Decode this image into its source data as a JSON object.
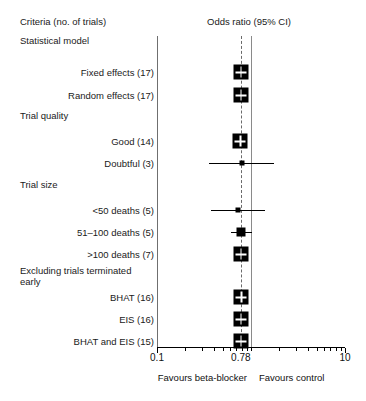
{
  "headers": {
    "left": "Criteria (no. of trials)",
    "right": "Odds ratio (95% CI)"
  },
  "rows": [
    {
      "label": "Statistical model",
      "type": "group",
      "indent": 0
    },
    {
      "label": "Fixed effects (17)",
      "type": "item",
      "indent": 1,
      "or": 0.78,
      "lo": 0.71,
      "hi": 0.86,
      "box": "large"
    },
    {
      "label": "Random effects (17)",
      "type": "item",
      "indent": 1,
      "or": 0.78,
      "lo": 0.7,
      "hi": 0.87,
      "box": "large"
    },
    {
      "label": "Trial quality",
      "type": "group",
      "indent": 0
    },
    {
      "label": "Good (14)",
      "type": "item",
      "indent": 1,
      "or": 0.77,
      "lo": 0.7,
      "hi": 0.85,
      "box": "large"
    },
    {
      "label": "Doubtful (3)",
      "type": "item",
      "indent": 1,
      "or": 0.8,
      "lo": 0.36,
      "hi": 1.75,
      "box": "small"
    },
    {
      "label": "Trial size",
      "type": "group",
      "indent": 0
    },
    {
      "label": "<50 deaths (5)",
      "type": "item",
      "indent": 1,
      "or": 0.73,
      "lo": 0.38,
      "hi": 1.4,
      "box": "small"
    },
    {
      "label": "51–100 deaths (5)",
      "type": "item",
      "indent": 1,
      "or": 0.79,
      "lo": 0.62,
      "hi": 1.02,
      "box": "medium"
    },
    {
      "label": ">100 deaths (7)",
      "type": "item",
      "indent": 1,
      "or": 0.78,
      "lo": 0.7,
      "hi": 0.87,
      "box": "large"
    },
    {
      "label": "Excluding trials terminated early",
      "type": "group",
      "indent": 0,
      "wrap": true
    },
    {
      "label": "BHAT (16)",
      "type": "item",
      "indent": 1,
      "or": 0.79,
      "lo": 0.71,
      "hi": 0.88,
      "box": "large"
    },
    {
      "label": "EIS (16)",
      "type": "item",
      "indent": 1,
      "or": 0.78,
      "lo": 0.7,
      "hi": 0.87,
      "box": "large"
    },
    {
      "label": "BHAT and EIS (15)",
      "type": "item",
      "indent": 1,
      "or": 0.78,
      "lo": 0.7,
      "hi": 0.88,
      "box": "large"
    }
  ],
  "axis": {
    "min": 0.1,
    "max": 10,
    "scale": "log",
    "tick_labels": [
      "0.1",
      "0.78",
      "10"
    ],
    "tick_values": [
      0.1,
      0.78,
      10
    ],
    "minor_ticks": [
      0.2,
      0.3,
      0.4,
      0.5,
      0.6,
      0.7,
      0.8,
      0.9,
      1,
      2,
      3,
      4,
      5,
      6,
      7,
      8,
      9
    ],
    "null_value": 1.0,
    "pooled_value": 0.78
  },
  "footer": {
    "left": "Favours beta-blocker",
    "right": "Favours control"
  },
  "chart_data": {
    "type": "forest",
    "title": "Odds ratio (95% CI)",
    "xlabel": "Odds ratio",
    "xscale": "log",
    "xlim": [
      0.1,
      10
    ],
    "reference_line": 1.0,
    "pooled_line": 0.78,
    "categories": [
      "Fixed effects (17)",
      "Random effects (17)",
      "Good (14)",
      "Doubtful (3)",
      "<50 deaths (5)",
      "51–100 deaths (5)",
      ">100 deaths (7)",
      "BHAT (16)",
      "EIS (16)",
      "BHAT and EIS (15)"
    ],
    "values": [
      0.78,
      0.78,
      0.77,
      0.8,
      0.73,
      0.79,
      0.78,
      0.79,
      0.78,
      0.78
    ],
    "ci_low": [
      0.71,
      0.7,
      0.7,
      0.36,
      0.38,
      0.62,
      0.7,
      0.71,
      0.7,
      0.7
    ],
    "ci_high": [
      0.86,
      0.87,
      0.85,
      1.75,
      1.4,
      1.02,
      0.87,
      0.88,
      0.87,
      0.88
    ],
    "groups": [
      "Statistical model",
      "Trial quality",
      "Trial size",
      "Excluding trials terminated early"
    ],
    "grid": false,
    "legend": false
  },
  "colors": {
    "marker": "#000000",
    "axis": "#000000",
    "null_line": "#8a8a8a",
    "pooled_line": "#6a6a6a"
  }
}
